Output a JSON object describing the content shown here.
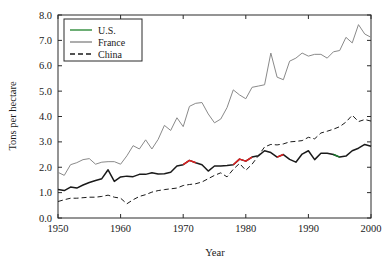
{
  "chart_data": {
    "type": "line",
    "title": "",
    "xlabel": "Year",
    "ylabel": "Tons per hectare",
    "xlim": [
      1950,
      2000
    ],
    "ylim": [
      0.0,
      8.0
    ],
    "xticks": [
      1950,
      1960,
      1970,
      1980,
      1990,
      2000
    ],
    "xtick_labels": [
      "1950",
      "1960",
      "1970",
      "1980",
      "1990",
      "2000"
    ],
    "yticks": [
      0.0,
      1.0,
      2.0,
      3.0,
      4.0,
      5.0,
      6.0,
      7.0,
      8.0
    ],
    "ytick_labels": [
      "0.0",
      "1.0",
      "2.0",
      "3.0",
      "4.0",
      "5.0",
      "6.0",
      "7.0",
      "8.0"
    ],
    "grid": false,
    "legend_position": "upper-left",
    "x": [
      1950,
      1951,
      1952,
      1953,
      1954,
      1955,
      1956,
      1957,
      1958,
      1959,
      1960,
      1961,
      1962,
      1963,
      1964,
      1965,
      1966,
      1967,
      1968,
      1969,
      1970,
      1971,
      1972,
      1973,
      1974,
      1975,
      1976,
      1977,
      1978,
      1979,
      1980,
      1981,
      1982,
      1983,
      1984,
      1985,
      1986,
      1987,
      1988,
      1989,
      1990,
      1991,
      1992,
      1993,
      1994,
      1995,
      1996,
      1997,
      1998,
      1999,
      2000
    ],
    "series": [
      {
        "name": "U.S.",
        "color": "#1a1a1a",
        "accent_color": "#e02020",
        "style": "solid",
        "values": [
          1.12,
          1.08,
          1.22,
          1.18,
          1.3,
          1.4,
          1.48,
          1.55,
          1.9,
          1.44,
          1.62,
          1.65,
          1.63,
          1.72,
          1.72,
          1.78,
          1.73,
          1.74,
          1.8,
          2.05,
          2.1,
          2.27,
          2.18,
          2.1,
          1.85,
          2.05,
          2.05,
          2.07,
          2.1,
          2.32,
          2.24,
          2.4,
          2.45,
          2.65,
          2.58,
          2.4,
          2.5,
          2.31,
          2.2,
          2.52,
          2.65,
          2.3,
          2.55,
          2.55,
          2.5,
          2.4,
          2.44,
          2.65,
          2.75,
          2.9,
          2.83
        ]
      },
      {
        "name": "France",
        "color": "#8a8a8a",
        "style": "solid",
        "values": [
          1.8,
          1.68,
          2.1,
          2.18,
          2.3,
          2.34,
          2.12,
          2.2,
          2.22,
          2.22,
          2.12,
          2.45,
          2.85,
          2.72,
          3.08,
          2.72,
          3.1,
          3.65,
          3.45,
          3.95,
          3.6,
          4.4,
          4.52,
          4.55,
          4.1,
          3.75,
          3.9,
          4.35,
          5.05,
          4.85,
          4.7,
          5.15,
          5.2,
          5.25,
          6.5,
          5.55,
          5.45,
          6.18,
          6.3,
          6.5,
          6.38,
          6.45,
          6.45,
          6.3,
          6.55,
          6.6,
          7.12,
          6.9,
          7.62,
          7.25,
          7.12
        ]
      },
      {
        "name": "China",
        "color": "#1a1a1a",
        "style": "dashed",
        "values": [
          0.65,
          0.72,
          0.78,
          0.78,
          0.8,
          0.82,
          0.82,
          0.85,
          0.9,
          0.82,
          0.78,
          0.56,
          0.72,
          0.85,
          0.92,
          1.02,
          1.08,
          1.12,
          1.15,
          1.18,
          1.28,
          1.32,
          1.35,
          1.42,
          1.55,
          1.68,
          1.78,
          1.62,
          1.92,
          2.15,
          1.88,
          2.12,
          2.45,
          2.8,
          2.9,
          2.88,
          2.92,
          3.0,
          3.02,
          3.05,
          3.18,
          3.12,
          3.35,
          3.42,
          3.5,
          3.6,
          3.78,
          4.05,
          3.8,
          3.88,
          3.82
        ]
      }
    ],
    "highlight_segments": [
      {
        "series": "U.S.",
        "from": 1970,
        "to": 1972,
        "color": "#e02020"
      },
      {
        "series": "U.S.",
        "from": 1978,
        "to": 1981,
        "color": "#e02020"
      },
      {
        "series": "U.S.",
        "from": 1985,
        "to": 1986,
        "color": "#e02020"
      },
      {
        "series": "U.S.",
        "from": 1994,
        "to": 1995,
        "color": "#1a7a2e"
      }
    ]
  },
  "legend": {
    "entries": [
      {
        "label": "U.S.",
        "color": "#2e8b3a",
        "style": "solid"
      },
      {
        "label": "France",
        "color": "#8a8a8a",
        "style": "solid"
      },
      {
        "label": "China",
        "color": "#1a1a1a",
        "style": "dashed"
      }
    ]
  },
  "axes": {
    "x_title": "Year",
    "y_title": "Tons per hectare"
  }
}
